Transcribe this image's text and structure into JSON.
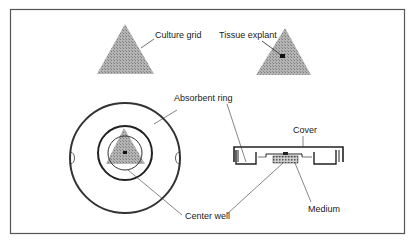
{
  "figure": {
    "colors": {
      "frame": "#555555",
      "outline": "#333333",
      "grid_fill": "#a8a8a8",
      "explant": "#111111",
      "background": "#ffffff"
    }
  },
  "labels": {
    "culture_grid": "Culture grid",
    "tissue_explant": "Tissue explant",
    "absorbent_ring": "Absorbent ring",
    "center_well": "Center well",
    "cover": "Cover",
    "medium": "Medium"
  },
  "views": {
    "grid_alone": "culture-grid-triangle",
    "grid_with_explant": "culture-grid-with-explant",
    "dish_top": "dish-top-view",
    "dish_side": "dish-cross-section"
  }
}
